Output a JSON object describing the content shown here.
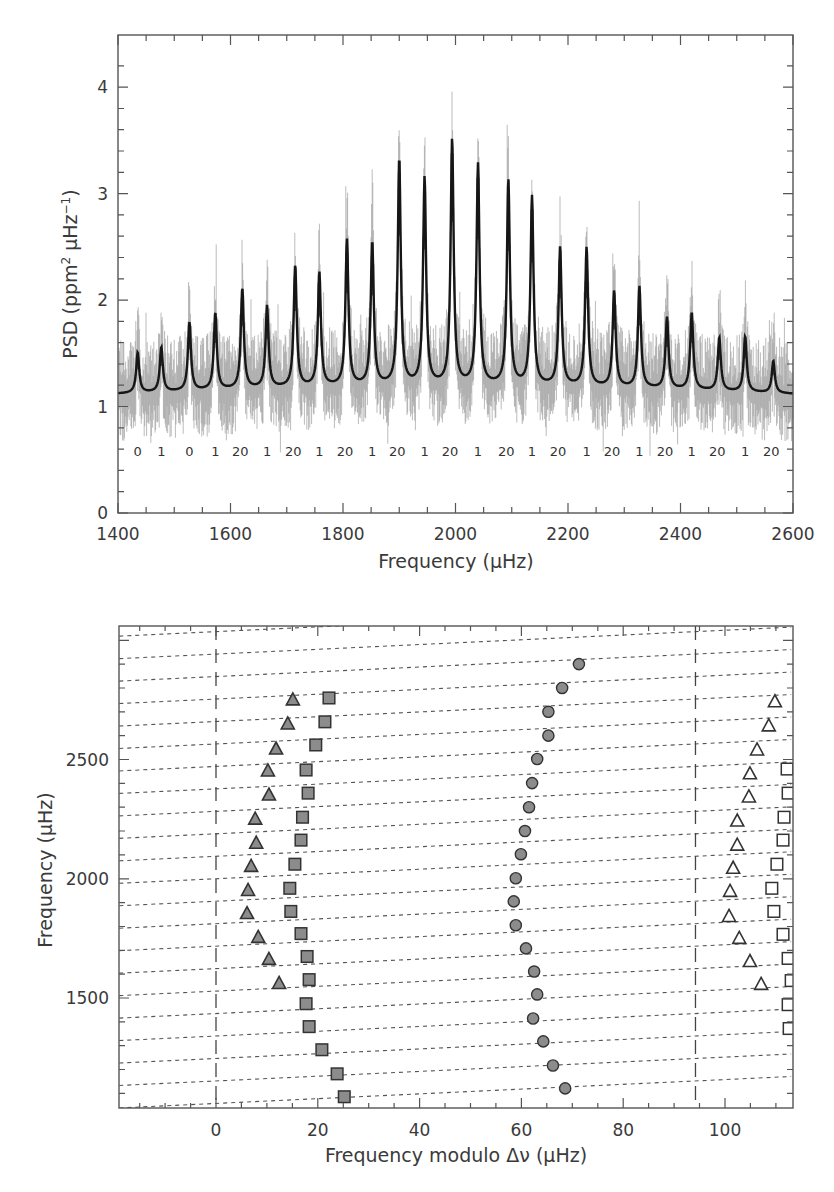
{
  "chart_data": [
    {
      "type": "line",
      "panel": "top",
      "title": "",
      "xlabel": "Frequency (μHz)",
      "ylabel": "PSD (ppm² μHz⁻¹)",
      "xlim": [
        1400,
        2600
      ],
      "ylim": [
        0,
        4.5
      ],
      "x_ticks": [
        1400,
        1600,
        1800,
        2000,
        2200,
        2400,
        2600
      ],
      "y_ticks": [
        0,
        1,
        2,
        3,
        4
      ],
      "grid": false,
      "series": [
        {
          "name": "power spectrum (smoothed, gray)",
          "color": "#9a9a9a"
        },
        {
          "name": "Lorentzian fit (black)",
          "color": "#1a1a1a"
        }
      ],
      "background_level": 1.12,
      "peaks": [
        {
          "freq": 1435,
          "fit_height": 1.46,
          "max_spike": 1.95,
          "label": "0"
        },
        {
          "freq": 1477,
          "fit_height": 1.5,
          "max_spike": 1.95,
          "label": "1"
        },
        {
          "freq": 1527,
          "fit_height": 1.72,
          "max_spike": 2.15,
          "label": "0"
        },
        {
          "freq": 1573,
          "fit_height": 1.8,
          "max_spike": 2.75,
          "label": "1"
        },
        {
          "freq": 1621,
          "fit_height": 2.02,
          "max_spike": 2.45,
          "label": "20"
        },
        {
          "freq": 1665,
          "fit_height": 1.85,
          "max_spike": 2.72,
          "label": "1"
        },
        {
          "freq": 1715,
          "fit_height": 2.22,
          "max_spike": 2.3,
          "label": "20"
        },
        {
          "freq": 1758,
          "fit_height": 2.15,
          "max_spike": 3.62,
          "label": "1"
        },
        {
          "freq": 1807,
          "fit_height": 2.45,
          "max_spike": 3.25,
          "label": "20"
        },
        {
          "freq": 1852,
          "fit_height": 2.42,
          "max_spike": 3.42,
          "label": "1"
        },
        {
          "freq": 1900,
          "fit_height": 3.2,
          "max_spike": 3.62,
          "label": "20"
        },
        {
          "freq": 1945,
          "fit_height": 3.02,
          "max_spike": 3.25,
          "label": "1"
        },
        {
          "freq": 1994,
          "fit_height": 3.38,
          "max_spike": 3.62,
          "label": "20"
        },
        {
          "freq": 2040,
          "fit_height": 3.15,
          "max_spike": 4.1,
          "label": "1"
        },
        {
          "freq": 2094,
          "fit_height": 3.0,
          "max_spike": 4.0,
          "label": "20"
        },
        {
          "freq": 2136,
          "fit_height": 2.85,
          "max_spike": 3.15,
          "label": "1"
        },
        {
          "freq": 2186,
          "fit_height": 2.38,
          "max_spike": 3.15,
          "label": "20"
        },
        {
          "freq": 2233,
          "fit_height": 2.38,
          "max_spike": 2.78,
          "label": "1"
        },
        {
          "freq": 2282,
          "fit_height": 1.98,
          "max_spike": 2.35,
          "label": "20"
        },
        {
          "freq": 2327,
          "fit_height": 2.03,
          "max_spike": 2.75,
          "label": "1"
        },
        {
          "freq": 2376,
          "fit_height": 1.75,
          "max_spike": 2.55,
          "label": "20"
        },
        {
          "freq": 2420,
          "fit_height": 1.8,
          "max_spike": 2.3,
          "label": "1"
        },
        {
          "freq": 2469,
          "fit_height": 1.58,
          "max_spike": 2.1,
          "label": "20"
        },
        {
          "freq": 2515,
          "fit_height": 1.6,
          "max_spike": 2.2,
          "label": "1"
        },
        {
          "freq": 2565,
          "fit_height": 1.38,
          "max_spike": 2.0,
          "label": "20"
        }
      ],
      "mode_labels_y": 0.58
    },
    {
      "type": "scatter",
      "panel": "bottom",
      "title": "echelle diagram",
      "xlabel": "Frequency modulo Δν (μHz)",
      "ylabel": "Frequency (μHz)",
      "xlim": [
        -19,
        113
      ],
      "ylim": [
        1038,
        3060
      ],
      "x_ticks": [
        0,
        20,
        40,
        60,
        80,
        100
      ],
      "y_ticks": [
        1500,
        2000,
        2500
      ],
      "grid": false,
      "large_separation": 94.2,
      "vertical_dashed_lines_x": [
        0,
        94.2
      ],
      "series": [
        {
          "name": "l=1 (gray circles)",
          "marker": "circle",
          "fill": "#8c8c8c",
          "points": [
            [
              71.3,
              2900
            ],
            [
              68.0,
              2800
            ],
            [
              65.3,
              2700
            ],
            [
              65.3,
              2600
            ],
            [
              63.1,
              2502
            ],
            [
              62.1,
              2401
            ],
            [
              61.5,
              2300
            ],
            [
              60.7,
              2200
            ],
            [
              59.9,
              2103
            ],
            [
              58.9,
              2002
            ],
            [
              58.5,
              1905
            ],
            [
              58.9,
              1805
            ],
            [
              60.9,
              1708
            ],
            [
              62.5,
              1611
            ],
            [
              63.1,
              1515
            ],
            [
              62.3,
              1414
            ],
            [
              64.3,
              1318
            ],
            [
              66.2,
              1217
            ],
            [
              68.6,
              1121
            ]
          ]
        },
        {
          "name": "l=2 (gray triangles)",
          "marker": "triangle",
          "fill": "#8c8c8c",
          "points": [
            [
              15.1,
              2750
            ],
            [
              14.1,
              2649
            ],
            [
              11.8,
              2544
            ],
            [
              10.2,
              2452
            ],
            [
              10.4,
              2351
            ],
            [
              7.7,
              2250
            ],
            [
              7.9,
              2149
            ],
            [
              6.9,
              2052
            ],
            [
              6.3,
              1951
            ],
            [
              6.1,
              1854
            ],
            [
              8.3,
              1754
            ],
            [
              10.4,
              1662
            ],
            [
              12.4,
              1561
            ]
          ]
        },
        {
          "name": "l=0 (gray squares)",
          "marker": "square",
          "fill": "#8c8c8c",
          "points": [
            [
              22.2,
              2758
            ],
            [
              21.4,
              2658
            ],
            [
              19.6,
              2561
            ],
            [
              17.7,
              2456
            ],
            [
              18.1,
              2359
            ],
            [
              17.0,
              2258
            ],
            [
              16.7,
              2162
            ],
            [
              15.5,
              2061
            ],
            [
              14.5,
              1960
            ],
            [
              14.7,
              1863
            ],
            [
              16.7,
              1770
            ],
            [
              17.9,
              1674
            ],
            [
              18.3,
              1577
            ],
            [
              17.7,
              1476
            ],
            [
              18.3,
              1380
            ],
            [
              20.8,
              1283
            ],
            [
              23.8,
              1182
            ],
            [
              25.2,
              1086
            ]
          ]
        },
        {
          "name": "l=2 (open triangles, wrapped)",
          "marker": "triangle-open",
          "fill": "none",
          "points": [
            [
              109.8,
              2742
            ],
            [
              108.6,
              2641
            ],
            [
              106.3,
              2540
            ],
            [
              104.9,
              2440
            ],
            [
              104.7,
              2343
            ],
            [
              102.4,
              2242
            ],
            [
              102.4,
              2141
            ],
            [
              101.6,
              2044
            ],
            [
              101.0,
              1947
            ],
            [
              100.8,
              1842
            ],
            [
              102.8,
              1750
            ],
            [
              104.9,
              1653
            ],
            [
              107.1,
              1557
            ]
          ]
        },
        {
          "name": "l=0 (open squares, wrapped)",
          "marker": "square-open",
          "fill": "none",
          "points": [
            [
              112.2,
              2460
            ],
            [
              112.4,
              2359
            ],
            [
              111.6,
              2258
            ],
            [
              111.4,
              2162
            ],
            [
              110.2,
              2061
            ],
            [
              109.2,
              1960
            ],
            [
              109.6,
              1863
            ],
            [
              111.4,
              1767
            ],
            [
              112.4,
              1666
            ],
            [
              113.0,
              1573
            ],
            [
              112.4,
              1472
            ],
            [
              112.6,
              1372
            ]
          ]
        }
      ],
      "ridge_lines": {
        "style": "dashed",
        "color": "#555555",
        "count": 23,
        "intercept_at_x0_first": 1058,
        "spacing": 94.2,
        "slope_uHz_per_uHz": 1.0
      }
    }
  ],
  "top_panel": {
    "x_tick_labels": [
      "1400",
      "1600",
      "1800",
      "2000",
      "2200",
      "2400",
      "2600"
    ],
    "y_tick_labels": [
      "0",
      "1",
      "2",
      "3",
      "4"
    ],
    "xlabel": "Frequency (μHz)",
    "ylabel_main": "PSD (ppm",
    "ylabel_sup1": "2",
    "ylabel_mid": " μHz",
    "ylabel_sup2": "−1",
    "ylabel_end": ")"
  },
  "bottom_panel": {
    "x_tick_labels": [
      "0",
      "20",
      "40",
      "60",
      "80",
      "100"
    ],
    "y_tick_labels": [
      "1500",
      "2000",
      "2500"
    ],
    "xlabel": "Frequency modulo Δν (μHz)",
    "ylabel": "Frequency (μHz)"
  },
  "colors": {
    "axis": "#555555",
    "noise": "#9e9e9e",
    "fit": "#161616",
    "marker_fill": "#8c8c8c",
    "marker_stroke": "#333333"
  }
}
